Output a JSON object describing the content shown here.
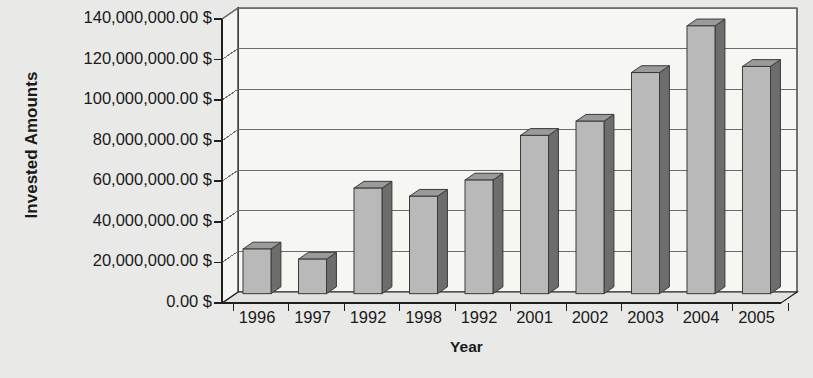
{
  "chart_data": {
    "type": "bar",
    "title": "",
    "subtitle": "",
    "xlabel": "Year",
    "ylabel": "Invested Amounts",
    "categories": [
      "1996",
      "1997",
      "1992",
      "1998",
      "1992",
      "2001",
      "2002",
      "2003",
      "2004",
      "2005"
    ],
    "values": [
      22000000,
      17000000,
      52000000,
      48000000,
      56000000,
      78000000,
      85000000,
      109000000,
      132000000,
      112000000
    ],
    "series": [
      {
        "name": "Invested Amounts",
        "values": [
          22000000,
          17000000,
          52000000,
          48000000,
          56000000,
          78000000,
          85000000,
          109000000,
          132000000,
          112000000
        ]
      }
    ],
    "ylim": [
      0,
      140000000
    ],
    "ytick_values": [
      0,
      20000000,
      40000000,
      60000000,
      80000000,
      100000000,
      120000000,
      140000000
    ],
    "ytick_labels": [
      "0.00 $",
      "20,000,000.00 $",
      "40,000,000.00 $",
      "60,000,000.00 $",
      "80,000,000.00 $",
      "100,000,000.00 $",
      "120,000,000.00 $",
      "140,000,000.00 $"
    ],
    "grid": true,
    "grid_axis": "y",
    "legend": false,
    "legend_position": "none",
    "style": "3d-column",
    "annotations": []
  },
  "colors": {
    "page_background": "#e9e9e7",
    "plot_background": "#f6f6f3",
    "floor": "#e3e3df",
    "bar_front": "#b9b9b9",
    "bar_side": "#6d6d6d",
    "bar_top": "#9a9a9a",
    "bar_outline": "#3a3a3a",
    "gridline": "#6b6b6b",
    "axis_line": "#1f1f1f",
    "text": "#1a1a1a"
  }
}
